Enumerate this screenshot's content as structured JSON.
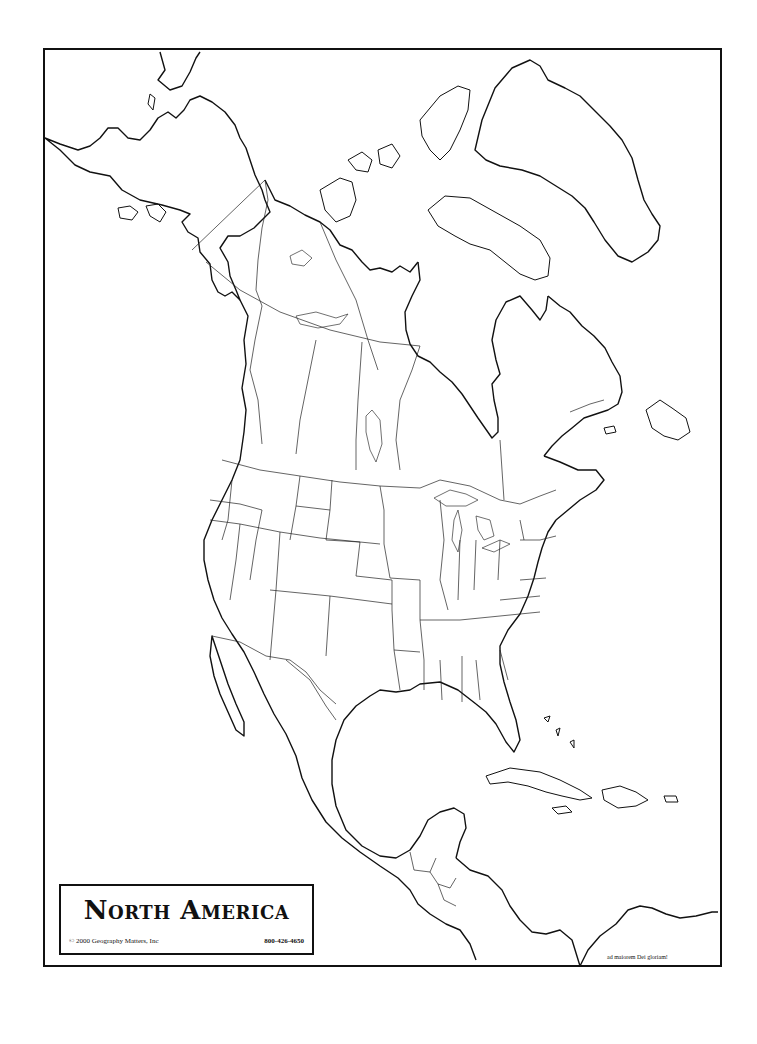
{
  "map": {
    "title": "North America",
    "copyright": "© 2000 Geography Matters, Inc",
    "phone": "800-426-4650",
    "motto": "ad maiorem Dei gloriam!",
    "style": "blank outline map",
    "regions_depicted": [
      "Alaska",
      "Canada",
      "Greenland",
      "United States",
      "Mexico",
      "Central America",
      "Caribbean"
    ],
    "colors": {
      "line": "#111111",
      "background": "#ffffff"
    }
  }
}
